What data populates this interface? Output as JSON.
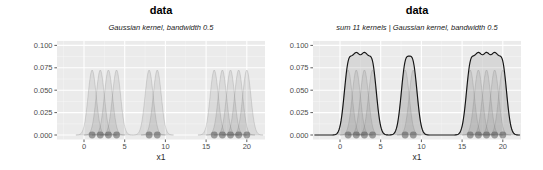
{
  "chart_data": [
    {
      "type": "area",
      "title": "data",
      "subtitle": "Gaussian kernel, bandwidth 0.5",
      "xlabel": "x1",
      "kernel": "Gaussian",
      "bandwidth": 0.5,
      "n_kernels": 11,
      "points": [
        1,
        2,
        3,
        4,
        8,
        9,
        16,
        17,
        18,
        19,
        20
      ],
      "kernel_peak_height": 0.0725,
      "show_sum": false,
      "x_ticks": [
        0,
        5,
        10,
        15,
        20
      ],
      "x_tick_labels": [
        "0",
        "5",
        "10",
        "15",
        "20"
      ],
      "y_ticks": [
        0,
        0.025,
        0.05,
        0.075,
        0.1
      ],
      "y_tick_labels": [
        "0.000",
        "0.025",
        "0.050",
        "0.075",
        "0.100"
      ],
      "xlim": [
        -3.3,
        22.3
      ],
      "ylim": [
        -0.005,
        0.105
      ],
      "grid": true,
      "legend": "none"
    },
    {
      "type": "area",
      "title": "data",
      "subtitle": "sum 11 kernels | Gaussian kernel, bandwidth 0.5",
      "xlabel": "x1",
      "kernel": "Gaussian",
      "bandwidth": 0.5,
      "n_kernels": 11,
      "points": [
        1,
        2,
        3,
        4,
        8,
        9,
        16,
        17,
        18,
        19,
        20
      ],
      "kernel_peak_height": 0.0725,
      "show_sum": true,
      "sum_peaks": {
        "cluster_1_4": 0.092,
        "cluster_8_9": 0.088,
        "cluster_16_20": 0.092
      },
      "x_ticks": [
        0,
        5,
        10,
        15,
        20
      ],
      "x_tick_labels": [
        "0",
        "5",
        "10",
        "15",
        "20"
      ],
      "y_ticks": [
        0,
        0.025,
        0.05,
        0.075,
        0.1
      ],
      "y_tick_labels": [
        "0.000",
        "0.025",
        "0.050",
        "0.075",
        "0.100"
      ],
      "xlim": [
        -3.3,
        22.3
      ],
      "ylim": [
        -0.005,
        0.105
      ],
      "grid": true,
      "legend": "none"
    }
  ],
  "colors": {
    "background": "#FFFFFF",
    "panel_bg": "#EBEBEB",
    "grid_major": "#FFFFFF",
    "grid_minor": "#FFFFFF",
    "kernel_fill": "rgba(110,110,110,0.13)",
    "kernel_stroke": "rgba(95,95,95,0.35)",
    "sum_line": "#141414",
    "sum_fill": "rgba(110,110,110,0.16)",
    "point": "#4A4A4A",
    "axis_text": "#4D4D4D",
    "tick_mark": "#333333"
  }
}
